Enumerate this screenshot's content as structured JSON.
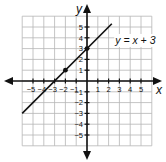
{
  "chart_data": {
    "type": "line",
    "title": "",
    "xlabel": "x",
    "ylabel": "y",
    "xlim": [
      -6,
      6
    ],
    "ylim": [
      -6,
      6
    ],
    "grid": true,
    "x_ticks": [
      -5,
      -4,
      -3,
      -2,
      -1,
      1,
      2,
      3,
      4,
      5
    ],
    "y_ticks": [
      -5,
      -4,
      -3,
      -2,
      -1,
      1,
      2,
      3,
      4,
      5
    ],
    "x_tick_labels": [
      "−5",
      "−4",
      "−3",
      "−2",
      "−1",
      "1",
      "2",
      "3",
      "4",
      "5"
    ],
    "y_tick_labels": [
      "−5",
      "−4",
      "−3",
      "−2",
      "−1",
      "1",
      "2",
      "3",
      "4",
      "5"
    ],
    "series": [
      {
        "name": "y = x + 3",
        "equation": "y = x + 3",
        "slope": 1,
        "intercept": 3,
        "x": [
          -6,
          2.3
        ],
        "y": [
          -3,
          5.3
        ],
        "points": [
          [
            -2,
            1
          ],
          [
            0,
            3
          ]
        ]
      }
    ],
    "annotations": [
      {
        "text": "y = x + 3",
        "x": 2.8,
        "y": 3.8
      }
    ],
    "colors": {
      "grid": "#b5b5b5",
      "axis": "#111111",
      "line": "#111111"
    }
  }
}
